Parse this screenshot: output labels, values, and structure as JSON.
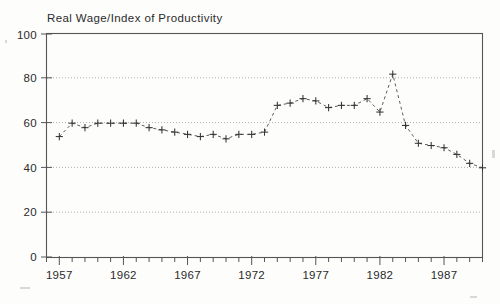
{
  "chart_data": {
    "type": "line",
    "title": "Real Wage/Index of Productivity",
    "xlabel": "",
    "ylabel": "",
    "xlim": [
      1956,
      1990
    ],
    "ylim": [
      0,
      100
    ],
    "grid": true,
    "legend": null,
    "marker": "plus",
    "linestyle": "dashed",
    "y_ticks": [
      0,
      20,
      40,
      60,
      80,
      100
    ],
    "y_tick_labels": [
      "0",
      "20",
      "40",
      "60",
      "80",
      "100"
    ],
    "x_ticks": [
      1957,
      1962,
      1967,
      1972,
      1977,
      1982,
      1987
    ],
    "x_tick_labels": [
      "1957",
      "1962",
      "1967",
      "1972",
      "1977",
      "1982",
      "1987"
    ],
    "x_minor_tick_interval": 1,
    "x": [
      1957,
      1958,
      1959,
      1960,
      1961,
      1962,
      1963,
      1964,
      1965,
      1966,
      1967,
      1968,
      1969,
      1970,
      1971,
      1972,
      1973,
      1974,
      1975,
      1976,
      1977,
      1978,
      1979,
      1980,
      1981,
      1982,
      1983,
      1984,
      1985,
      1986,
      1987,
      1988,
      1989,
      1990
    ],
    "values": [
      54,
      60,
      58,
      60,
      60,
      60,
      60,
      58,
      57,
      56,
      55,
      54,
      55,
      53,
      55,
      55,
      56,
      68,
      69,
      71,
      70,
      67,
      68,
      68,
      71,
      65,
      82,
      59,
      51,
      50,
      49,
      46,
      42,
      40
    ],
    "annotations": []
  },
  "axes": {
    "frame_color": "#555555",
    "grid_color": "#9a9a9a",
    "series_color": "#3a3a3a"
  }
}
